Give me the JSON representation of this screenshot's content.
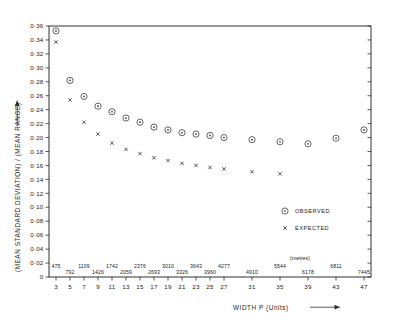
{
  "chart_data": {
    "type": "scatter",
    "title": "",
    "xlabel": "WIDTH P (Units)",
    "ylabel": "(MEAN STANDARD DEVIATION) / (MEAN RANGE)",
    "xlim": [
      2,
      48
    ],
    "ylim": [
      0,
      0.36
    ],
    "grid": false,
    "legend_position": "inside-right",
    "secondary_axis_caption": "(metres)",
    "x_tick_labels": [
      "3",
      "5",
      "7",
      "9",
      "11",
      "13",
      "15",
      "17",
      "19",
      "21",
      "23",
      "25",
      "27",
      "31",
      "35",
      "39",
      "43",
      "47"
    ],
    "x_tick_values": [
      3,
      5,
      7,
      9,
      11,
      13,
      15,
      17,
      19,
      21,
      23,
      25,
      27,
      31,
      35,
      39,
      43,
      47
    ],
    "secondary_x_labels": [
      "475",
      "792",
      "1109",
      "1426",
      "1742",
      "2059",
      "2376",
      "2693",
      "3010",
      "3326",
      "3643",
      "3960",
      "4277",
      "4910",
      "5544",
      "6178",
      "6811",
      "7445"
    ],
    "y_tick_labels": [
      "0",
      "0·02",
      "0·04",
      "0·06",
      "0·08",
      "0·10",
      "0·12",
      "0·14",
      "0·16",
      "0·18",
      "0·20",
      "0·22",
      "0·24",
      "0·26",
      "0·28",
      "0·30",
      "0·32",
      "0·34",
      "0·36"
    ],
    "y_tick_values": [
      0,
      0.02,
      0.04,
      0.06,
      0.08,
      0.1,
      0.12,
      0.14,
      0.16,
      0.18,
      0.2,
      0.22,
      0.24,
      0.26,
      0.28,
      0.3,
      0.32,
      0.34,
      0.36
    ],
    "series": [
      {
        "name": "OBSERVED",
        "marker": "circle-dot",
        "x": [
          3,
          5,
          7,
          9,
          11,
          13,
          15,
          17,
          19,
          21,
          23,
          25,
          27,
          31,
          35,
          39,
          43,
          47
        ],
        "values": [
          0.353,
          0.282,
          0.259,
          0.245,
          0.237,
          0.228,
          0.222,
          0.215,
          0.211,
          0.207,
          0.205,
          0.203,
          0.2,
          0.197,
          0.194,
          0.191,
          0.199,
          0.211
        ]
      },
      {
        "name": "EXPECTED",
        "marker": "x",
        "x": [
          3,
          5,
          7,
          9,
          11,
          13,
          15,
          17,
          19,
          21,
          23,
          25,
          27,
          31,
          35
        ],
        "values": [
          0.337,
          0.254,
          0.222,
          0.205,
          0.192,
          0.183,
          0.177,
          0.171,
          0.167,
          0.163,
          0.16,
          0.157,
          0.155,
          0.151,
          0.148
        ]
      }
    ]
  },
  "legend": {
    "observed_label": "OBSERVED",
    "expected_label": "EXPECTED"
  },
  "axes": {
    "x_title": "WIDTH P (Units)",
    "y_title": "(MEAN STANDARD DEVIATION) / (MEAN RANGE)",
    "metres_caption": "(metres)"
  }
}
